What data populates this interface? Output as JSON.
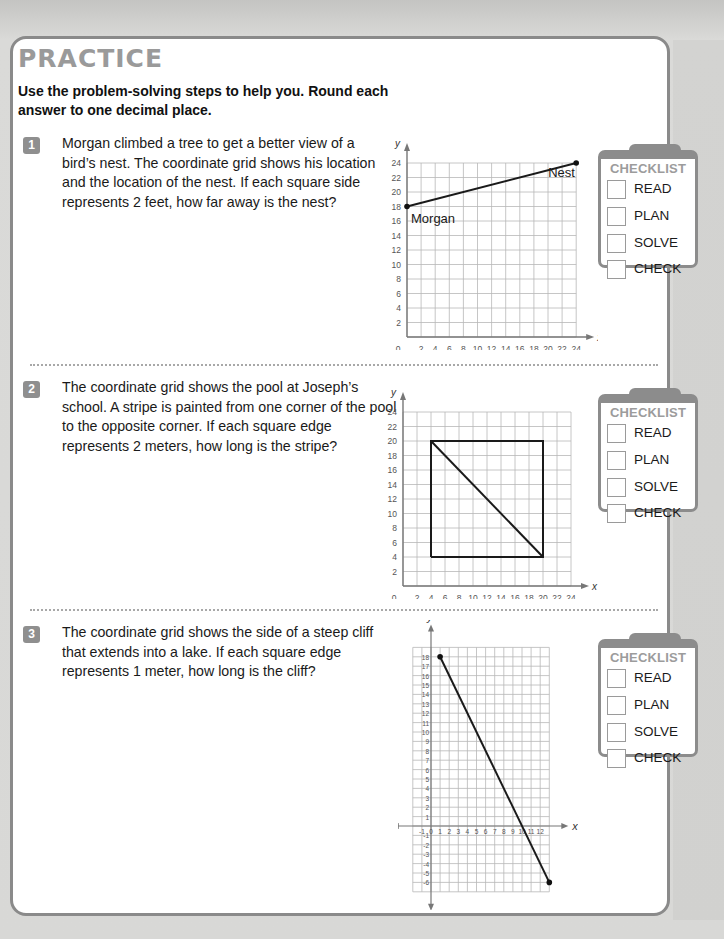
{
  "page": {
    "title": "PRACTICE",
    "instructions": "Use the problem-solving steps to help you. Round each answer to one decimal place."
  },
  "problems": [
    {
      "number": "1",
      "text": "Morgan climbed a tree to get a better view of a bird’s nest. The coordinate grid shows his location and the location of the nest. If each square side represents 2 feet, how far away is the nest?",
      "checklist": {
        "heading": "CHECKLIST",
        "items": [
          "READ",
          "PLAN",
          "SOLVE",
          "CHECK"
        ]
      }
    },
    {
      "number": "2",
      "text": "The coordinate grid shows the pool at Joseph’s school. A stripe is painted from one corner of the pool to the opposite corner. If each square edge represents 2 meters, how long is the stripe?",
      "checklist": {
        "heading": "CHECKLIST",
        "items": [
          "READ",
          "PLAN",
          "SOLVE",
          "CHECK"
        ]
      }
    },
    {
      "number": "3",
      "text": "The coordinate grid shows the side of a steep cliff that extends into a lake. If each square edge represents 1 meter, how long is the cliff?",
      "checklist": {
        "heading": "CHECKLIST",
        "items": [
          "READ",
          "PLAN",
          "SOLVE",
          "CHECK"
        ]
      }
    }
  ],
  "chart_data": [
    {
      "type": "line",
      "title": "",
      "xlabel": "x",
      "ylabel": "y",
      "xlim": [
        0,
        24
      ],
      "ylim": [
        0,
        24
      ],
      "x_ticks": [
        0,
        2,
        4,
        6,
        8,
        10,
        12,
        14,
        16,
        18,
        20,
        22,
        24
      ],
      "y_ticks": [
        2,
        4,
        6,
        8,
        10,
        12,
        14,
        16,
        18,
        20,
        22,
        24
      ],
      "grid": true,
      "series": [
        {
          "name": "segment",
          "x": [
            0,
            24
          ],
          "y": [
            18,
            24
          ]
        }
      ],
      "points": [
        {
          "label": "Morgan",
          "x": 0,
          "y": 18
        },
        {
          "label": "Nest",
          "x": 24,
          "y": 24
        }
      ]
    },
    {
      "type": "line",
      "title": "",
      "xlabel": "x",
      "ylabel": "y",
      "xlim": [
        0,
        24
      ],
      "ylim": [
        0,
        24
      ],
      "x_ticks": [
        0,
        2,
        4,
        6,
        8,
        10,
        12,
        14,
        16,
        18,
        20,
        22,
        24
      ],
      "y_ticks": [
        2,
        4,
        6,
        8,
        10,
        12,
        14,
        16,
        18,
        20,
        22,
        24
      ],
      "grid": true,
      "series": [
        {
          "name": "pool",
          "x": [
            4,
            20,
            20,
            4,
            4
          ],
          "y": [
            4,
            4,
            20,
            20,
            4
          ]
        },
        {
          "name": "stripe",
          "x": [
            4,
            20
          ],
          "y": [
            20,
            4
          ]
        }
      ]
    },
    {
      "type": "line",
      "title": "",
      "xlabel": "x",
      "ylabel": "y",
      "xlim": [
        -2,
        13
      ],
      "ylim": [
        -7,
        19
      ],
      "x_ticks": [
        -1,
        0,
        1,
        2,
        3,
        4,
        5,
        6,
        7,
        8,
        9,
        10,
        11,
        12
      ],
      "y_ticks": [
        -6,
        -5,
        -4,
        -3,
        -2,
        -1,
        1,
        2,
        3,
        4,
        5,
        6,
        7,
        8,
        9,
        10,
        11,
        12,
        13,
        14,
        15,
        16,
        17,
        18
      ],
      "grid": true,
      "series": [
        {
          "name": "cliff",
          "x": [
            1,
            13
          ],
          "y": [
            18,
            -6
          ]
        }
      ],
      "points": [
        {
          "label": "",
          "x": 1,
          "y": 18
        },
        {
          "label": "",
          "x": 13,
          "y": -6
        }
      ]
    }
  ]
}
